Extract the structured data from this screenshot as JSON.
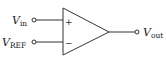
{
  "diagram": {
    "type": "op-amp comparator",
    "colors": {
      "stroke": "#333333",
      "text": "#222222",
      "background": "#ffffff"
    },
    "inputs": [
      {
        "label_main": "V",
        "label_sub": "in",
        "polarity": "+"
      },
      {
        "label_main": "V",
        "label_sub": "REF",
        "polarity": "−"
      }
    ],
    "output": {
      "label_main": "V",
      "label_sub": "out"
    },
    "signs": {
      "plus": "+",
      "minus": "−"
    }
  }
}
